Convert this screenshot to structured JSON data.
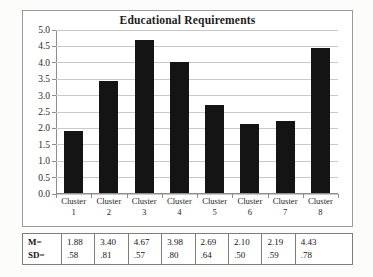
{
  "chart_data": {
    "type": "bar",
    "title": "Educational Requirements",
    "xlabel": "",
    "ylabel": "",
    "categories": [
      "Cluster 1",
      "Cluster 2",
      "Cluster 3",
      "Cluster 4",
      "Cluster 5",
      "Cluster 6",
      "Cluster 7",
      "Cluster 8"
    ],
    "category_lines": [
      {
        "top": "Cluster",
        "num": "1"
      },
      {
        "top": "Cluster",
        "num": "2"
      },
      {
        "top": "Cluster",
        "num": "3"
      },
      {
        "top": "Cluster",
        "num": "4"
      },
      {
        "top": "Cluster",
        "num": "5"
      },
      {
        "top": "Cluster",
        "num": "6"
      },
      {
        "top": "Cluster",
        "num": "7"
      },
      {
        "top": "Cluster",
        "num": "8"
      }
    ],
    "values": [
      1.88,
      3.4,
      4.67,
      3.98,
      2.69,
      2.1,
      2.19,
      4.43
    ],
    "ylim": [
      0.0,
      5.0
    ],
    "ytick_step": 0.5,
    "ytick_labels": [
      "0.0",
      "0.5",
      "1.0",
      "1.5",
      "2.0",
      "2.5",
      "3.0",
      "3.5",
      "4.0",
      "4.5",
      "5.0"
    ],
    "grid": true,
    "legend": false,
    "bar_color": "#141414",
    "gridline_color": "#c9c9c9",
    "axis_color": "#8d8d8d"
  },
  "stats_table": {
    "row_labels": [
      "M=",
      "SD="
    ],
    "mean_values": [
      "1.88",
      "3.40",
      "4.67",
      "3.98",
      "2.69",
      "2.10",
      "2.19",
      "4.43"
    ],
    "sd_values": [
      ".58",
      ".81",
      ".57",
      ".80",
      ".64",
      ".50",
      ".59",
      ".78"
    ]
  }
}
